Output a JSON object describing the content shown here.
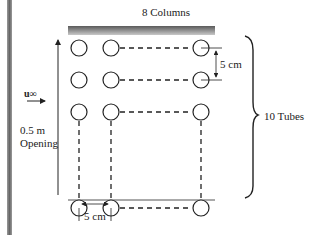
{
  "diagram": {
    "top_label": "8 Columns",
    "right_label": "10 Tubes",
    "vertical_spacing_label": "5 cm",
    "horizontal_spacing_label": "5 cm",
    "opening_label_line1": "0.5 m",
    "opening_label_line2": "Opening",
    "flow_label": "u∞",
    "columns": 8,
    "tubes_per_column": 10,
    "visible_columns_x": [
      79,
      111,
      201
    ],
    "visible_rows_y": [
      48,
      80,
      112,
      208
    ]
  }
}
